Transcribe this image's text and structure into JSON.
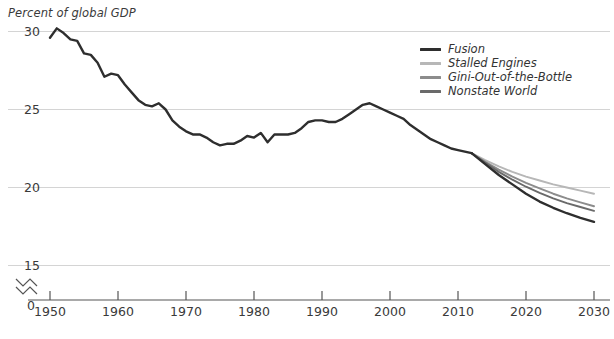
{
  "chart_data": {
    "type": "line",
    "title": "",
    "ylabel": "Percent of global GDP",
    "xlabel": "",
    "ylim": [
      15,
      31
    ],
    "xlim": [
      1949,
      2030
    ],
    "grid": true,
    "y_ticks": [
      "30",
      "25",
      "20",
      "15"
    ],
    "y_tick_values": [
      30,
      25,
      20,
      15
    ],
    "axis_break_label": "0",
    "axis_break_symbol": "zigzag",
    "x_ticks": [
      "1950",
      "1960",
      "1970",
      "1980",
      "1990",
      "2000",
      "2010",
      "2020",
      "2030"
    ],
    "x_tick_values": [
      1950,
      1960,
      1970,
      1980,
      1990,
      2000,
      2010,
      2020,
      2030
    ],
    "legend_position": "top-right",
    "series": [
      {
        "name": "Fusion",
        "color": "#2e2e2e",
        "x": [
          2012,
          2014,
          2016,
          2018,
          2020,
          2022,
          2024,
          2026,
          2028,
          2030
        ],
        "values": [
          22.2,
          21.5,
          20.8,
          20.2,
          19.6,
          19.1,
          18.7,
          18.35,
          18.05,
          17.8
        ]
      },
      {
        "name": "Stalled Engines",
        "color": "#b7b7b7",
        "x": [
          2012,
          2014,
          2016,
          2018,
          2020,
          2022,
          2024,
          2026,
          2028,
          2030
        ],
        "values": [
          22.2,
          21.75,
          21.35,
          21.0,
          20.7,
          20.45,
          20.2,
          20.0,
          19.8,
          19.6
        ]
      },
      {
        "name": "Gini-Out-of-the-Bottle",
        "color": "#8c8c8c",
        "x": [
          2012,
          2014,
          2016,
          2018,
          2020,
          2022,
          2024,
          2026,
          2028,
          2030
        ],
        "values": [
          22.2,
          21.65,
          21.15,
          20.7,
          20.3,
          19.95,
          19.6,
          19.3,
          19.05,
          18.8
        ]
      },
      {
        "name": "Nonstate World",
        "color": "#6a6a6a",
        "x": [
          2012,
          2014,
          2016,
          2018,
          2020,
          2022,
          2024,
          2026,
          2028,
          2030
        ],
        "values": [
          22.2,
          21.6,
          21.0,
          20.5,
          20.05,
          19.65,
          19.3,
          19.0,
          18.75,
          18.5
        ]
      },
      {
        "name": "Historical",
        "color": "#2e2e2e",
        "x": [
          1950,
          1951,
          1952,
          1953,
          1954,
          1955,
          1956,
          1957,
          1958,
          1959,
          1960,
          1961,
          1962,
          1963,
          1964,
          1965,
          1966,
          1967,
          1968,
          1969,
          1970,
          1971,
          1972,
          1973,
          1974,
          1975,
          1976,
          1977,
          1978,
          1979,
          1980,
          1981,
          1982,
          1983,
          1984,
          1985,
          1986,
          1987,
          1988,
          1989,
          1990,
          1991,
          1992,
          1993,
          1994,
          1995,
          1996,
          1997,
          1998,
          1999,
          2000,
          2001,
          2002,
          2003,
          2004,
          2005,
          2006,
          2007,
          2008,
          2009,
          2010,
          2011,
          2012
        ],
        "values": [
          29.6,
          30.2,
          29.9,
          29.5,
          29.4,
          28.6,
          28.5,
          28.0,
          27.1,
          27.3,
          27.2,
          26.6,
          26.1,
          25.6,
          25.3,
          25.2,
          25.4,
          25.0,
          24.3,
          23.9,
          23.6,
          23.4,
          23.4,
          23.2,
          22.9,
          22.7,
          22.8,
          22.8,
          23.0,
          23.3,
          23.2,
          23.5,
          22.9,
          23.4,
          23.4,
          23.4,
          23.5,
          23.8,
          24.2,
          24.3,
          24.3,
          24.2,
          24.2,
          24.4,
          24.7,
          25.0,
          25.3,
          25.4,
          25.2,
          25.0,
          24.8,
          24.6,
          24.4,
          24.0,
          23.7,
          23.4,
          23.1,
          22.9,
          22.7,
          22.5,
          22.4,
          22.3,
          22.2
        ]
      }
    ]
  },
  "legend": {
    "items": [
      {
        "label": "Fusion",
        "color": "#2e2e2e"
      },
      {
        "label": "Stalled Engines",
        "color": "#b7b7b7"
      },
      {
        "label": "Gini-Out-of-the-Bottle",
        "color": "#8c8c8c"
      },
      {
        "label": "Nonstate World",
        "color": "#6a6a6a"
      }
    ]
  },
  "axes": {
    "y_title": "Percent of global GDP",
    "y_labels": [
      "30",
      "25",
      "20",
      "15"
    ],
    "zero_label": "0",
    "x_labels": [
      "1950",
      "1960",
      "1970",
      "1980",
      "1990",
      "2000",
      "2010",
      "2020",
      "2030"
    ]
  },
  "colors": {
    "gridline": "#d4d4d4",
    "axis": "#555555",
    "text": "#3a3a3a"
  }
}
